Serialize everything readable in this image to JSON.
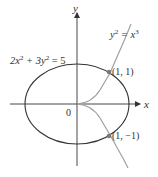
{
  "diagram": {
    "axes": {
      "x_label": "x",
      "y_label": "y",
      "origin_label": "0"
    },
    "curves": [
      {
        "name": "ellipse",
        "equation_parts": [
          "2x",
          "2",
          " + 3y",
          "2",
          " = 5"
        ],
        "color": "#333333"
      },
      {
        "name": "cusp",
        "equation_parts": [
          "y",
          "2",
          " = x",
          "3"
        ],
        "color": "#a0a0a0"
      }
    ],
    "points": [
      {
        "label": "(1, 1)",
        "x": 1,
        "y": 1
      },
      {
        "label": "(1, −1)",
        "x": 1,
        "y": -1
      }
    ],
    "colors": {
      "axis": "#333333",
      "ellipse": "#333333",
      "cusp": "#a0a0a0",
      "point": "#7a7a7a"
    }
  }
}
